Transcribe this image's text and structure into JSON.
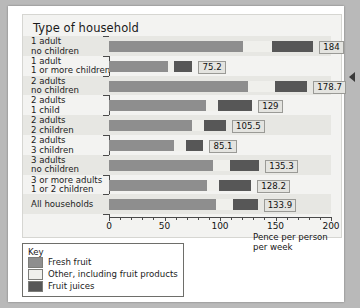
{
  "chart_data": {
    "type": "bar",
    "orientation": "horizontal",
    "stacked": true,
    "title": "Type of household",
    "xlabel": "Pence per person per week",
    "ylabel": "Type of household",
    "xlim": [
      0,
      200
    ],
    "xticks": [
      0,
      50,
      100,
      150,
      200
    ],
    "xticklabels": [
      "0",
      "50",
      "100",
      "150",
      "200"
    ],
    "minor_tick_step": 10,
    "grid": false,
    "legend_position": "below-left",
    "categories": [
      "1 adult no children",
      "1 adult 1 or more children",
      "2 adults no children",
      "2 adults 1 child",
      "2 adults 2 children",
      "2 adults 3 children",
      "3 adults no children",
      "3 or more adults 1 or 2 children",
      "All households"
    ],
    "category_lines": [
      [
        "1 adult",
        "no children"
      ],
      [
        "1 adult",
        "1 or more children"
      ],
      [
        "2 adults",
        "no children"
      ],
      [
        "2 adults",
        "1 child"
      ],
      [
        "2 adults",
        "2 children"
      ],
      [
        "2 adults",
        "3 children"
      ],
      [
        "3 adults",
        "no children"
      ],
      [
        "3 or more adults",
        "1 or 2 children"
      ],
      [
        "All households"
      ]
    ],
    "series": [
      {
        "name": "Fresh fruit",
        "color": "#8e8e8e",
        "values": [
          121.0,
          53.5,
          125.5,
          87.0,
          74.5,
          58.5,
          94.0,
          88.0,
          96.0
        ]
      },
      {
        "name": "Other, including fruit products",
        "color": "#f0f0ec",
        "values": [
          26.0,
          5.5,
          24.0,
          11.0,
          11.0,
          11.0,
          15.0,
          11.0,
          16.0
        ]
      },
      {
        "name": "Fruit juices",
        "color": "#575757",
        "values": [
          37.0,
          16.2,
          29.2,
          31.0,
          20.0,
          15.6,
          26.3,
          29.2,
          21.9
        ]
      }
    ],
    "totals": [
      184,
      75.2,
      178.7,
      129,
      105.5,
      85.1,
      135.3,
      128.2,
      133.9
    ],
    "total_labels": [
      "184",
      "75.2",
      "178.7",
      "129",
      "105.5",
      "85.1",
      "135.3",
      "128.2",
      "133.9"
    ]
  },
  "key": {
    "title": "Key",
    "items": [
      {
        "label": "Fresh fruit",
        "color": "#8e8e8e",
        "swatch": "fresh"
      },
      {
        "label": "Other, including fruit products",
        "color": "#f0f0ec",
        "swatch": "other"
      },
      {
        "label": "Fruit juices",
        "color": "#575757",
        "swatch": "juice"
      }
    ]
  },
  "axis_title_lines": [
    "Pence per person",
    "per week"
  ]
}
